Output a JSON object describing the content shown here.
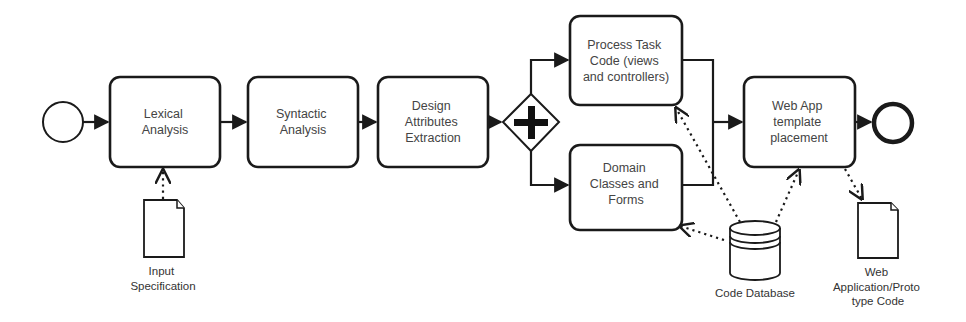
{
  "diagram": {
    "type": "BPMN process",
    "start_event": {
      "label": ""
    },
    "tasks": [
      {
        "id": "lexical",
        "lines": [
          "Lexical",
          "Analysis"
        ]
      },
      {
        "id": "syntactic",
        "lines": [
          "Syntactic",
          "Analysis"
        ]
      },
      {
        "id": "design",
        "lines": [
          "Design",
          "Attributes",
          "Extraction"
        ]
      },
      {
        "id": "process",
        "lines": [
          "Process Task",
          "Code (views",
          "and controllers)"
        ]
      },
      {
        "id": "domain",
        "lines": [
          "Domain",
          "Classes and",
          "Forms"
        ]
      },
      {
        "id": "webapp",
        "lines": [
          "Web App",
          "template",
          "placement"
        ]
      }
    ],
    "gateway": {
      "type": "parallel",
      "symbol": "+"
    },
    "end_event": {
      "label": ""
    },
    "artifacts": {
      "input_spec": {
        "lines": [
          "Input",
          "Specification"
        ]
      },
      "code_db": {
        "lines": [
          "Code Database"
        ]
      },
      "web_output": {
        "lines": [
          "Web",
          "Application/Proto",
          "type Code"
        ]
      }
    },
    "sequence_flows": [
      [
        "start",
        "lexical"
      ],
      [
        "lexical",
        "syntactic"
      ],
      [
        "syntactic",
        "design"
      ],
      [
        "design",
        "gateway"
      ],
      [
        "gateway",
        "process"
      ],
      [
        "gateway",
        "domain"
      ],
      [
        "process",
        "webapp"
      ],
      [
        "domain",
        "webapp"
      ],
      [
        "webapp",
        "end"
      ]
    ],
    "associations": [
      [
        "input_spec",
        "lexical"
      ],
      [
        "code_db",
        "process"
      ],
      [
        "code_db",
        "domain"
      ],
      [
        "code_db",
        "webapp"
      ],
      [
        "webapp",
        "web_output"
      ]
    ]
  }
}
